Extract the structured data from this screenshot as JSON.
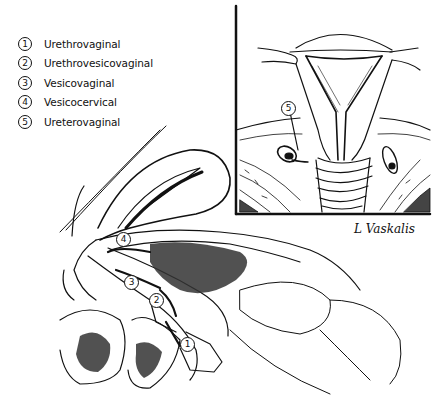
{
  "figure": {
    "legend": [
      {
        "number": "1",
        "label": "Urethrovaginal"
      },
      {
        "number": "2",
        "label": "Urethrovesicovaginal"
      },
      {
        "number": "3",
        "label": "Vesicovaginal"
      },
      {
        "number": "4",
        "label": "Vesicocervical"
      },
      {
        "number": "5",
        "label": "Ureterovaginal"
      }
    ],
    "callouts": {
      "c1": "1",
      "c2": "2",
      "c3": "3",
      "c4": "4",
      "c5": "5"
    },
    "signature": "L Vaskalis",
    "colors": {
      "ink": "#111111",
      "background": "#ffffff",
      "tissue_shade": "#555555"
    }
  }
}
